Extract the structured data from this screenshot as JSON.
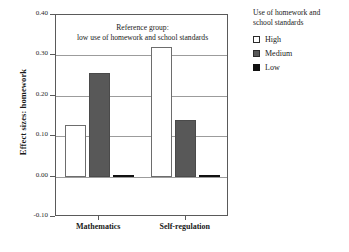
{
  "chart_data": {
    "type": "bar",
    "title": "",
    "annotation": [
      "Reference group:",
      "low use of homework and school standards"
    ],
    "xlabel": "",
    "ylabel": "Effect sizes: homework",
    "categories": [
      "Mathematics",
      "Self-regulation"
    ],
    "ylim": [
      -0.1,
      0.4
    ],
    "yticks": [
      "0.40",
      "0.30",
      "0.20",
      "0.10",
      "0.00",
      "-0.10"
    ],
    "ytick_values": [
      0.4,
      0.3,
      0.2,
      0.1,
      0.0,
      -0.1
    ],
    "grid": true,
    "legend_position": "right",
    "series": [
      {
        "name": "High",
        "color": "#ffffff",
        "values": [
          0.128,
          0.32
        ]
      },
      {
        "name": "Medium",
        "color": "#585858",
        "values": [
          0.257,
          0.14
        ]
      },
      {
        "name": "Low",
        "color": "#111111",
        "values": [
          0.005,
          0.005
        ]
      }
    ]
  },
  "legend": {
    "title_line1": "Use of homework and",
    "title_line2": "school standards",
    "items": [
      {
        "label": "High"
      },
      {
        "label": "Medium"
      },
      {
        "label": "Low"
      }
    ]
  }
}
